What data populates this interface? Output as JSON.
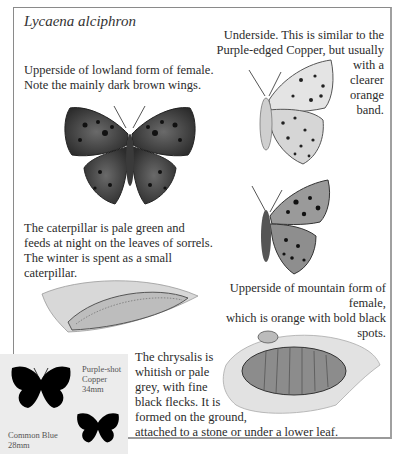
{
  "page": {
    "title": "Lycaena alciphron",
    "captions": {
      "lowland_female": "Upperside of lowland form of female. Note the mainly dark brown wings.",
      "underside_lines": [
        "Underside. This is similar to the",
        "Purple-edged Copper, but usually",
        "with a",
        "clearer",
        "orange",
        "band."
      ],
      "caterpillar": "The caterpillar is pale green and feeds at night on the leaves of sorrels. The winter is spent as a small caterpillar.",
      "mountain_female_lines": [
        "Upperside of mountain form of female,",
        "which is orange with bold black spots."
      ],
      "chrysalis_lines": [
        "The chrysalis is",
        "whitish or pale",
        "grey, with fine",
        "black flecks. It is",
        "formed on the ground,",
        "attached to a stone or under a lower leaf."
      ]
    },
    "size_comparison": {
      "items": [
        {
          "name_line1": "Purple-shot",
          "name_line2": "Copper",
          "size": "34mm"
        },
        {
          "name_line1": "Common Blue",
          "size": "28mm"
        }
      ]
    },
    "illustrations": {
      "lowland_female": "butterfly-upperside-dark-illustration",
      "underside": "butterfly-underside-illustration",
      "mountain_female": "butterfly-upperside-side-illustration",
      "caterpillar": "caterpillar-illustration",
      "chrysalis": "chrysalis-illustration"
    },
    "colors": {
      "frame": "#8a8a8a",
      "inset_bg": "#ececec",
      "text": "#2b2b2b",
      "silhouette": "#000000"
    }
  }
}
